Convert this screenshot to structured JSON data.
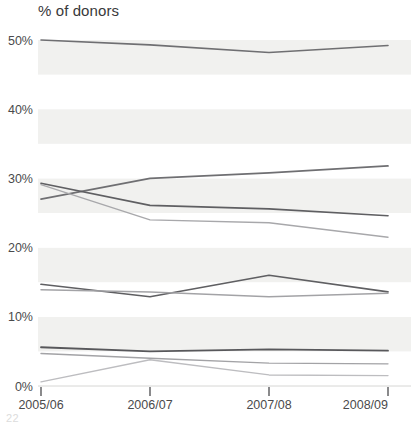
{
  "chart_data": {
    "type": "line",
    "title": "% of donors",
    "xlabel": "",
    "ylabel": "% of donors",
    "grid": "horizontal-bands",
    "legend": "none",
    "categories": [
      "2005/06",
      "2006/07",
      "2007/08",
      "2008/09"
    ],
    "x_tick_labels": [
      "2005/06",
      "2006/07",
      "2007/08",
      "2008/09"
    ],
    "y_tick_labels": [
      "0%",
      "10%",
      "20%",
      "30%",
      "40%",
      "50%"
    ],
    "y_tick_values": [
      0,
      10,
      20,
      30,
      40,
      50
    ],
    "ylim": [
      0,
      52
    ],
    "series": [
      {
        "name": "series-1",
        "color": "#6f6f72",
        "width": 1.6,
        "values": [
          50.0,
          49.3,
          48.2,
          49.2
        ]
      },
      {
        "name": "series-2",
        "color": "#6f6f72",
        "width": 1.7,
        "values": [
          27.0,
          30.0,
          30.8,
          31.8
        ]
      },
      {
        "name": "series-3",
        "color": "#5f5f62",
        "width": 1.7,
        "values": [
          29.3,
          26.1,
          25.6,
          24.6
        ]
      },
      {
        "name": "series-4",
        "color": "#a8a8ab",
        "width": 1.4,
        "values": [
          29.1,
          24.0,
          23.6,
          21.5
        ]
      },
      {
        "name": "series-5",
        "color": "#5f5f62",
        "width": 1.7,
        "values": [
          14.7,
          12.9,
          16.0,
          13.6
        ]
      },
      {
        "name": "series-6",
        "color": "#a3a3a6",
        "width": 1.5,
        "values": [
          13.9,
          13.6,
          12.9,
          13.4
        ]
      },
      {
        "name": "series-7",
        "color": "#58585b",
        "width": 1.8,
        "values": [
          5.6,
          5.0,
          5.3,
          5.1
        ]
      },
      {
        "name": "series-8",
        "color": "#a3a3a6",
        "width": 1.4,
        "values": [
          4.7,
          4.0,
          3.3,
          3.2
        ]
      },
      {
        "name": "series-9",
        "color": "#bdbdc0",
        "width": 1.4,
        "values": [
          0.6,
          3.8,
          1.6,
          1.5
        ]
      }
    ],
    "band_color": "#f1f1ef",
    "band_color_alt": "#ffffff",
    "axis_color": "#58585b"
  },
  "page": {
    "number": "22"
  }
}
